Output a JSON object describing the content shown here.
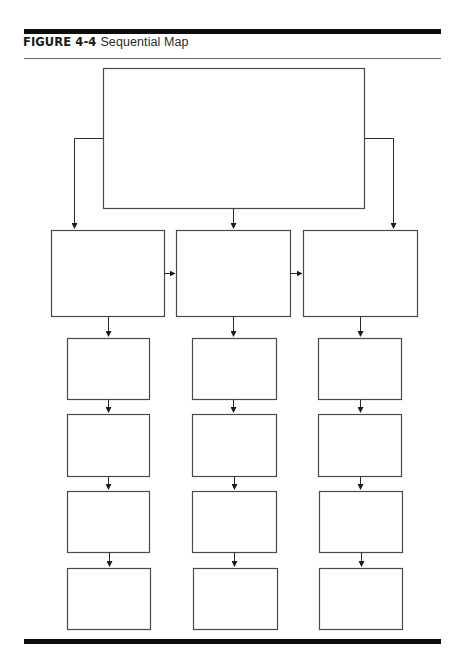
{
  "figure": {
    "label": "FIGURE 4-4",
    "title": "Sequential Map",
    "type": "sequential-map",
    "colors": {
      "rule": "#0d0d0d",
      "thin_rule": "#6a6a6a",
      "box_stroke": "#4a4a4a",
      "arrow": "#1a1a1a",
      "background": "#ffffff"
    }
  },
  "diagram": {
    "top_box": {
      "label": "",
      "x": 103,
      "y": 68,
      "w": 261,
      "h": 140
    },
    "main_row": [
      {
        "label": "",
        "x": 51,
        "y": 230,
        "w": 113,
        "h": 86
      },
      {
        "label": "",
        "x": 176,
        "y": 230,
        "w": 114,
        "h": 86
      },
      {
        "label": "",
        "x": 303,
        "y": 230,
        "w": 114,
        "h": 86
      }
    ],
    "columns": [
      {
        "center_x": 108,
        "boxes": [
          {
            "label": "",
            "x": 67,
            "y": 338,
            "w": 82,
            "h": 61
          },
          {
            "label": "",
            "x": 67,
            "y": 414,
            "w": 82,
            "h": 62
          },
          {
            "label": "",
            "x": 67,
            "y": 491,
            "w": 82,
            "h": 61
          },
          {
            "label": "",
            "x": 67,
            "y": 568,
            "w": 83,
            "h": 61
          }
        ]
      },
      {
        "center_x": 233,
        "boxes": [
          {
            "label": "",
            "x": 192,
            "y": 338,
            "w": 84,
            "h": 61
          },
          {
            "label": "",
            "x": 192,
            "y": 414,
            "w": 84,
            "h": 62
          },
          {
            "label": "",
            "x": 192,
            "y": 491,
            "w": 84,
            "h": 61
          },
          {
            "label": "",
            "x": 193,
            "y": 568,
            "w": 84,
            "h": 61
          }
        ]
      },
      {
        "center_x": 360,
        "boxes": [
          {
            "label": "",
            "x": 318,
            "y": 338,
            "w": 83,
            "h": 61
          },
          {
            "label": "",
            "x": 318,
            "y": 414,
            "w": 83,
            "h": 62
          },
          {
            "label": "",
            "x": 319,
            "y": 491,
            "w": 83,
            "h": 61
          },
          {
            "label": "",
            "x": 319,
            "y": 568,
            "w": 83,
            "h": 61
          }
        ]
      }
    ]
  }
}
